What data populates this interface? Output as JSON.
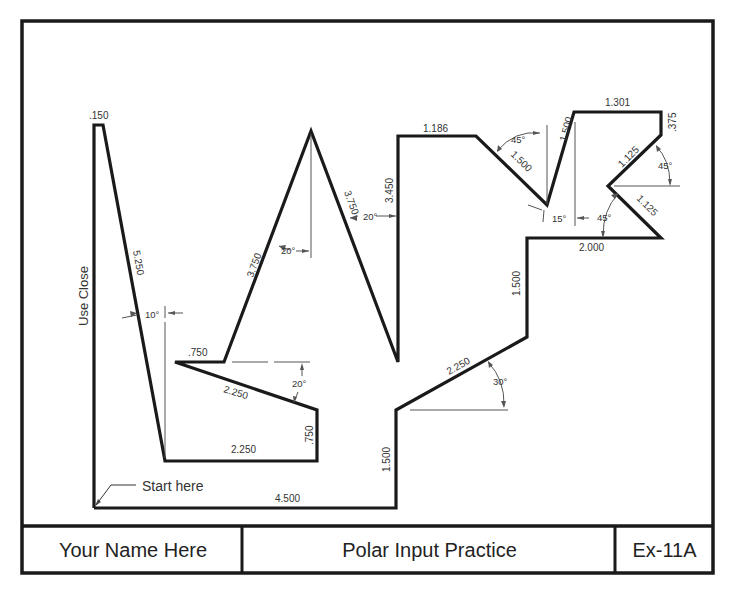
{
  "drawing": {
    "title": "Polar Input Practice",
    "author": "Your Name Here",
    "sheet_id": "Ex-11A",
    "colors": {
      "outline": "#1a1a1a",
      "dimension": "#555555",
      "text": "#333333"
    },
    "annotations": {
      "start": "Start here",
      "close": "Use Close"
    },
    "dimensions": {
      "bottom": "4.500",
      "right_lower_vertical": "1.500",
      "slope_30": "2.250",
      "angle_30": "30°",
      "right_mid_vertical": "1.500",
      "step_horizontal": "2.000",
      "lower_notch_edge": "1.125",
      "angle_lower_notch": "45°",
      "upper_notch_edge": "1.125",
      "angle_upper_notch": "45°",
      "top_right_vertical": ".375",
      "top_right_horizontal": "1.301",
      "steep_edge": "1.500",
      "angle_15": "15°",
      "v_edge": "1.500",
      "angle_v": "45°",
      "top_mid_horizontal": "1.186",
      "tall_vertical": "3.450",
      "peak_right": "3.750",
      "angle_peak_right": "20°",
      "peak_left": "3.750",
      "angle_peak_left": "20°",
      "inner_short": ".750",
      "inner_slope": "2.250",
      "angle_inner": "20°",
      "inner_vertical": ".750",
      "inner_bottom": "2.250",
      "long_slope": "5.250",
      "angle_long": "10°",
      "top_tip": ".150"
    }
  }
}
